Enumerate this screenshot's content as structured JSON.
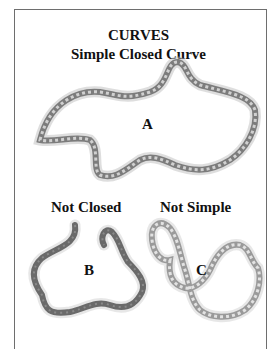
{
  "title": "CURVES",
  "subtitle": "Simple Closed Curve",
  "curves": [
    {
      "id": "A",
      "label": "A",
      "caption": "",
      "type": "simple-closed",
      "color": "#7a7a7a"
    },
    {
      "id": "B",
      "label": "B",
      "caption": "Not Closed",
      "type": "open",
      "color": "#666666"
    },
    {
      "id": "C",
      "label": "C",
      "caption": "Not Simple",
      "type": "self-intersecting",
      "color": "#9a9a9a"
    }
  ]
}
